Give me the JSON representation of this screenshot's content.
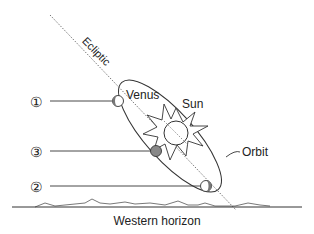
{
  "labels": {
    "ecliptic": "Ecliptic",
    "venus": "Venus",
    "sun": "Sun",
    "orbit": "Orbit",
    "horizon": "Western horizon"
  },
  "positions": [
    {
      "marker": "①",
      "id": "1",
      "shading": "left-dark"
    },
    {
      "marker": "③",
      "id": "3",
      "shading": "full-dark"
    },
    {
      "marker": "②",
      "id": "2",
      "shading": "right-dark"
    }
  ],
  "colors": {
    "line": "#333333",
    "dotted": "#666666",
    "planet_fill": "#ffffff",
    "planet_shade": "#777777"
  }
}
